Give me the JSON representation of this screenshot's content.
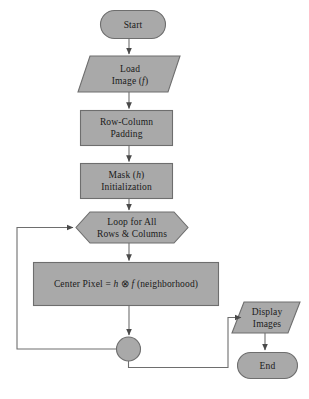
{
  "diagram": {
    "colors": {
      "node_fill": "#a9a9a9",
      "node_stroke": "#6e6e6e",
      "connector_stroke": "#6e6e6e",
      "text": "#1a1a1a",
      "background": "#ffffff"
    },
    "nodes": [
      {
        "id": "start",
        "shape": "terminator",
        "lines": [
          "Start"
        ]
      },
      {
        "id": "load",
        "shape": "parallelogram",
        "lines": [
          "Load",
          "Image (f)"
        ]
      },
      {
        "id": "rowcol",
        "shape": "rectangle",
        "lines": [
          "Row-Column",
          "Padding"
        ]
      },
      {
        "id": "mask",
        "shape": "rectangle",
        "lines": [
          "Mask (h)",
          "Initialization"
        ]
      },
      {
        "id": "loop",
        "shape": "hexagon",
        "lines": [
          "Loop for All",
          "Rows & Columns"
        ]
      },
      {
        "id": "center",
        "shape": "rectangle",
        "lines": [
          "Center Pixel = h ⊗ f (neighborhood)"
        ]
      },
      {
        "id": "display",
        "shape": "parallelogram",
        "lines": [
          "Display",
          "Images"
        ]
      },
      {
        "id": "end",
        "shape": "terminator",
        "lines": [
          "End"
        ]
      },
      {
        "id": "junction",
        "shape": "circle",
        "lines": []
      }
    ],
    "labels": {
      "start": "Start",
      "load_line1": "Load",
      "load_line2_prefix": "Image (",
      "load_line2_var": "f",
      "load_line2_suffix": ")",
      "rowcol_line1": "Row-Column",
      "rowcol_line2": "Padding",
      "mask_line1_prefix": "Mask (",
      "mask_line1_var": "h",
      "mask_line1_suffix": ")",
      "mask_line2": "Initialization",
      "loop_line1": "Loop for All",
      "loop_line2": "Rows & Columns",
      "center_prefix": "Center Pixel = ",
      "center_var_h": "h",
      "center_op": " ⊗ ",
      "center_var_f": "f",
      "center_suffix": " (neighborhood)",
      "display_line1": "Display",
      "display_line2": "Images",
      "end": "End"
    },
    "edges": [
      {
        "from": "start",
        "to": "load",
        "arrow": true,
        "kind": "vertical"
      },
      {
        "from": "load",
        "to": "rowcol",
        "arrow": true,
        "kind": "vertical"
      },
      {
        "from": "rowcol",
        "to": "mask",
        "arrow": true,
        "kind": "vertical"
      },
      {
        "from": "mask",
        "to": "loop",
        "arrow": true,
        "kind": "vertical"
      },
      {
        "from": "loop",
        "to": "center",
        "arrow": true,
        "kind": "vertical"
      },
      {
        "from": "center",
        "to": "junction",
        "arrow": true,
        "kind": "vertical"
      },
      {
        "from": "junction",
        "to": "loop",
        "arrow": true,
        "kind": "feedback-left"
      },
      {
        "from": "junction",
        "to": "display",
        "arrow": true,
        "kind": "exit-right"
      },
      {
        "from": "display",
        "to": "end",
        "arrow": true,
        "kind": "vertical"
      }
    ]
  }
}
